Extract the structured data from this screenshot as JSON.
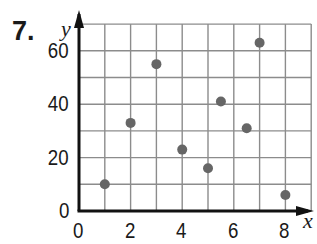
{
  "problem_number": "7.",
  "chart_data": {
    "type": "scatter",
    "title": "",
    "xlabel": "x",
    "ylabel": "y",
    "xlim": [
      0,
      9
    ],
    "ylim": [
      0,
      70
    ],
    "grid": true,
    "x_ticks": [
      "0",
      "2",
      "4",
      "6",
      "8"
    ],
    "y_ticks": [
      "0",
      "20",
      "40",
      "60"
    ],
    "points": [
      {
        "x": 1,
        "y": 10
      },
      {
        "x": 2,
        "y": 33
      },
      {
        "x": 3,
        "y": 55
      },
      {
        "x": 4,
        "y": 23
      },
      {
        "x": 5,
        "y": 16
      },
      {
        "x": 5.5,
        "y": 41
      },
      {
        "x": 6.5,
        "y": 31
      },
      {
        "x": 7,
        "y": 63
      },
      {
        "x": 8,
        "y": 6
      }
    ],
    "colors": {
      "grid": "#8c8c8c",
      "axis": "#111111",
      "point": "#666666"
    }
  }
}
